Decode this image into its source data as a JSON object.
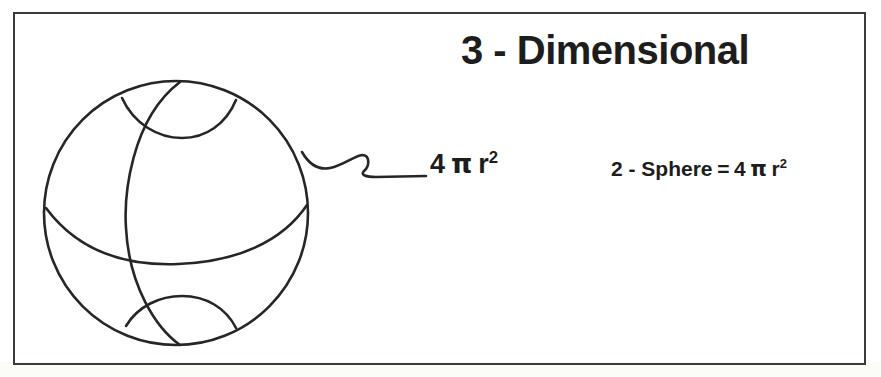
{
  "document": {
    "type": "hand-drawn scanned diagram",
    "background_color": "#ffffff",
    "ink_color": "#1d1d1d",
    "frame_color": "#3b3b3b"
  },
  "title": {
    "text": "3 - Dimensional"
  },
  "callout": {
    "label_prefix": "4",
    "label_pi": "π",
    "label_var": "r",
    "label_exponent": "2",
    "full_text": "4 π r²",
    "leader_line_name": "squiggly-leader-line"
  },
  "equation": {
    "left_side": "2 - Sphere",
    "equals": "=",
    "right_prefix": "4",
    "right_pi": "π",
    "right_var": "r",
    "right_exponent": "2",
    "full_text": "2 - Sphere = 4 π r²"
  },
  "figure": {
    "name": "sphere-wireframe",
    "parts": [
      "outer-circle",
      "meridian-curve",
      "equator-curve",
      "north-pole-arc",
      "south-pole-arc"
    ]
  }
}
